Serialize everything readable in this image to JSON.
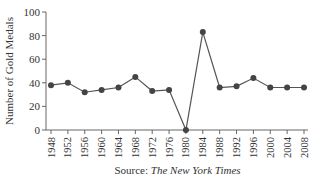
{
  "chart_data": {
    "type": "line",
    "title": "",
    "xlabel": "",
    "ylabel": "Number of Gold Medals",
    "ylim": [
      0,
      100
    ],
    "yticks": [
      0,
      20,
      40,
      60,
      80,
      100
    ],
    "grid": false,
    "legend": null,
    "categories": [
      "1948",
      "1952",
      "1956",
      "1960",
      "1964",
      "1968",
      "1972",
      "1976",
      "1980",
      "1984",
      "1988",
      "1992",
      "1996",
      "2000",
      "2004",
      "2008"
    ],
    "series": [
      {
        "name": "Gold Medals",
        "values": [
          38,
          40,
          32,
          34,
          36,
          45,
          33,
          34,
          0,
          83,
          36,
          37,
          44,
          36,
          36,
          36
        ],
        "color": "#555555",
        "marker": "circle"
      }
    ],
    "source_prefix": "Source: ",
    "source_title": "The New York Times"
  }
}
